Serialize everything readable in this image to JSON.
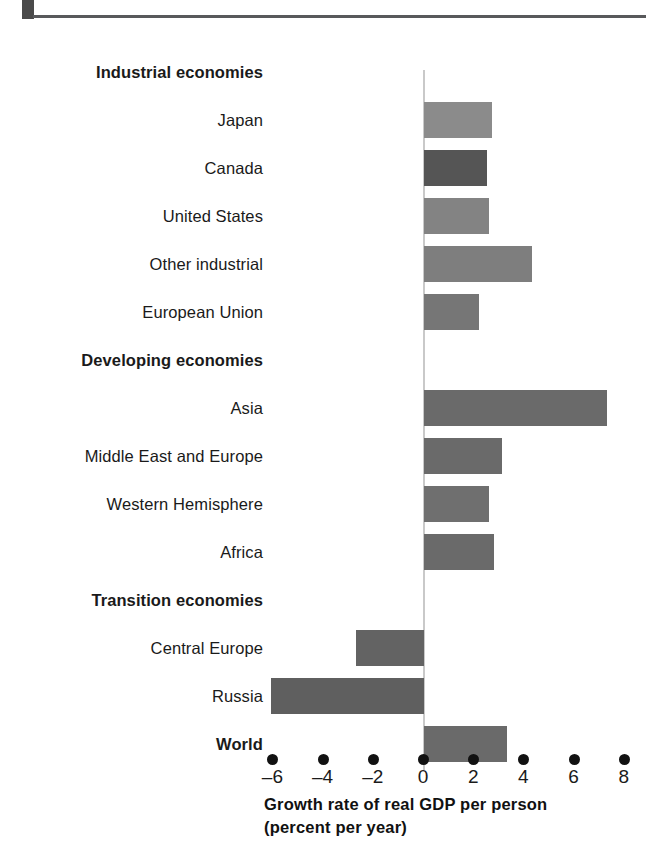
{
  "figure": {
    "header_block": "decorative-block",
    "axis_title_line1": "Growth rate of real GDP per person",
    "axis_title_line2": "(percent per year)"
  },
  "chart_data": {
    "type": "bar",
    "orientation": "horizontal",
    "title": "",
    "xlabel": "Growth rate of real GDP per person (percent per year)",
    "ylabel": "",
    "xlim": [
      -7,
      8.5
    ],
    "xticks": [
      -6,
      -4,
      -2,
      0,
      2,
      4,
      6,
      8
    ],
    "xtick_labels": [
      "–6",
      "–4",
      "–2",
      "0",
      "2",
      "4",
      "6",
      "8"
    ],
    "grid": false,
    "legend": null,
    "zero_line": 0,
    "groups": [
      {
        "label": "Industrial economies",
        "kind": "group-heading"
      },
      {
        "label": "Japan",
        "kind": "bar",
        "value": 2.7,
        "color": "#8b8b8b"
      },
      {
        "label": "Canada",
        "kind": "bar",
        "value": 2.5,
        "color": "#555555"
      },
      {
        "label": "United States",
        "kind": "bar",
        "value": 2.6,
        "color": "#838383"
      },
      {
        "label": "Other industrial",
        "kind": "bar",
        "value": 4.3,
        "color": "#7e7e7e"
      },
      {
        "label": "European Union",
        "kind": "bar",
        "value": 2.2,
        "color": "#767676"
      },
      {
        "label": "Developing economies",
        "kind": "group-heading"
      },
      {
        "label": "Asia",
        "kind": "bar",
        "value": 7.3,
        "color": "#6a6a6a"
      },
      {
        "label": "Middle East and Europe",
        "kind": "bar",
        "value": 3.1,
        "color": "#6a6a6a"
      },
      {
        "label": "Western Hemisphere",
        "kind": "bar",
        "value": 2.6,
        "color": "#6f6f6f"
      },
      {
        "label": "Africa",
        "kind": "bar",
        "value": 2.8,
        "color": "#6a6a6a"
      },
      {
        "label": "Transition economies",
        "kind": "group-heading"
      },
      {
        "label": "Central Europe",
        "kind": "bar",
        "value": -2.7,
        "color": "#636363"
      },
      {
        "label": "Russia",
        "kind": "bar",
        "value": -6.1,
        "color": "#5f5f5f"
      },
      {
        "label": "World",
        "kind": "bar",
        "value": 3.3,
        "color": "#6a6a6a",
        "bold": true
      }
    ]
  },
  "rows": [
    {
      "label": "Industrial economies"
    },
    {
      "label": "Japan"
    },
    {
      "label": "Canada"
    },
    {
      "label": "United States"
    },
    {
      "label": "Other industrial"
    },
    {
      "label": "European Union"
    },
    {
      "label": "Developing economies"
    },
    {
      "label": "Asia"
    },
    {
      "label": "Middle East and Europe"
    },
    {
      "label": "Western Hemisphere"
    },
    {
      "label": "Africa"
    },
    {
      "label": "Transition economies"
    },
    {
      "label": "Central Europe"
    },
    {
      "label": "Russia"
    },
    {
      "label": "World"
    }
  ]
}
